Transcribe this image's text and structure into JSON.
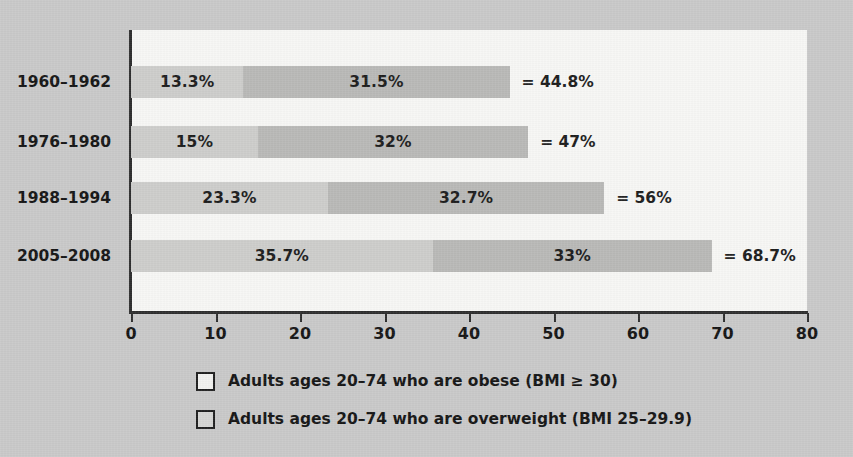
{
  "chart_data": {
    "type": "bar",
    "orientation": "horizontal",
    "stacked": true,
    "title": "",
    "xlabel": "",
    "ylabel": "",
    "xlim": [
      0,
      80
    ],
    "xticks": [
      0,
      10,
      20,
      30,
      40,
      50,
      60,
      70,
      80
    ],
    "xtick_labels": [
      "0",
      "10",
      "20",
      "30",
      "40",
      "50",
      "60",
      "70",
      "80"
    ],
    "grid": false,
    "legend_position": "bottom",
    "categories": [
      "1960–1962",
      "1976–1980",
      "1988–1994",
      "2005–2008"
    ],
    "series": [
      {
        "name": "Adults ages 20–74 who are obese (BMI ≥ 30)",
        "key": "obese",
        "color": "#cdcdcb",
        "values": [
          13.3,
          15,
          23.3,
          35.7
        ],
        "labels": [
          "13.3%",
          "15%",
          "23.3%",
          "35.7%"
        ]
      },
      {
        "name": "Adults ages 20–74 who are overweight (BMI 25–29.9)",
        "key": "overweight",
        "color": "#b9b9b7",
        "values": [
          31.5,
          32,
          32.7,
          33
        ],
        "labels": [
          "31.5%",
          "32%",
          "32.7%",
          "33%"
        ]
      }
    ],
    "totals": [
      44.8,
      47,
      56,
      68.7
    ],
    "total_labels": [
      "= 44.8%",
      "= 47%",
      "= 56%",
      "= 68.7%"
    ]
  },
  "rows": [
    {
      "year": "1960–1962",
      "obese_value": 13.3,
      "obese_label": "13.3%",
      "overweight_value": 31.5,
      "overweight_label": "31.5%",
      "total_label": "= 44.8%"
    },
    {
      "year": "1976–1980",
      "obese_value": 15,
      "obese_label": "15%",
      "overweight_value": 32,
      "overweight_label": "32%",
      "total_label": "= 47%"
    },
    {
      "year": "1988–1994",
      "obese_value": 23.3,
      "obese_label": "23.3%",
      "overweight_value": 32.7,
      "overweight_label": "32.7%",
      "total_label": "= 56%"
    },
    {
      "year": "2005–2008",
      "obese_value": 35.7,
      "obese_label": "35.7%",
      "overweight_value": 33,
      "overweight_label": "33%",
      "total_label": "= 68.7%"
    }
  ],
  "axis": {
    "ticks": [
      "0",
      "10",
      "20",
      "30",
      "40",
      "50",
      "60",
      "70",
      "80"
    ]
  },
  "legend": {
    "items": [
      {
        "key": "obese",
        "label": "Adults ages 20–74 who are obese (BMI ≥ 30)"
      },
      {
        "key": "overweight",
        "label": "Adults ages 20–74 who are overweight (BMI 25–29.9)"
      }
    ]
  },
  "colors": {
    "background": "#c9c9c9",
    "plot_background": "#f7f7f5",
    "axis": "#2e2e2e",
    "obese": "#cdcdcb",
    "overweight": "#b9b9b7",
    "text": "#151515"
  }
}
